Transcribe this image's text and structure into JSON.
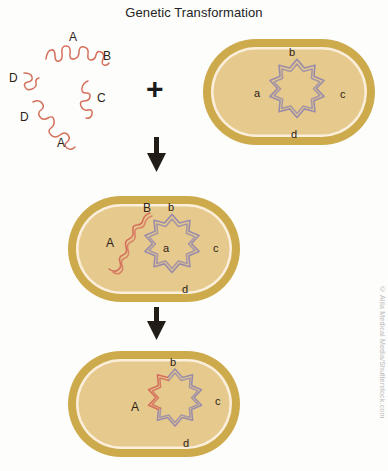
{
  "title": "Genetic Transformation",
  "credit": "© Alila Medical Media/Shutterstock.com",
  "colors": {
    "background": "#fdfdfb",
    "cell_wall": "#cdab4c",
    "cell_membrane": "#fbeedb",
    "cytoplasm": "#e6c98d",
    "donor_dna": "#d4705c",
    "chromosome": "#9b8da9",
    "arrow": "#221c16",
    "label_text": "#2c2216",
    "title_text": "#232323",
    "credit_text": "#b9b9b9"
  },
  "operators": {
    "plus": "+"
  },
  "panels": {
    "donor_dna": {
      "name": "free-donor-dna-fragments",
      "fragment_labels": [
        "A",
        "B",
        "C",
        "D",
        "D",
        "A"
      ],
      "labels": [
        {
          "text": "A",
          "x": 69,
          "y": 31
        },
        {
          "text": "B",
          "x": 103,
          "y": 50
        },
        {
          "text": "C",
          "x": 97,
          "y": 92
        },
        {
          "text": "D",
          "x": 9,
          "y": 72
        },
        {
          "text": "D",
          "x": 20,
          "y": 111
        },
        {
          "text": "A",
          "x": 57,
          "y": 137
        }
      ]
    },
    "recipient_cell": {
      "name": "recipient-bacterium",
      "chromosome_labels": [
        {
          "text": "b",
          "x": 289,
          "y": 47
        },
        {
          "text": "a",
          "x": 254,
          "y": 88
        },
        {
          "text": "c",
          "x": 340,
          "y": 89
        },
        {
          "text": "d",
          "x": 291,
          "y": 129
        }
      ]
    },
    "uptake_cell": {
      "name": "bacterium-with-internalized-dna",
      "donor_labels": [
        {
          "text": "A",
          "x": 106,
          "y": 237
        },
        {
          "text": "B",
          "x": 143,
          "y": 202
        }
      ],
      "chromosome_labels": [
        {
          "text": "b",
          "x": 168,
          "y": 202
        },
        {
          "text": "a",
          "x": 163,
          "y": 243
        },
        {
          "text": "c",
          "x": 213,
          "y": 243
        },
        {
          "text": "d",
          "x": 182,
          "y": 284
        }
      ]
    },
    "recombinant_cell": {
      "name": "transformed-bacterium",
      "donor_labels": [
        {
          "text": "A",
          "x": 131,
          "y": 401
        }
      ],
      "chromosome_labels": [
        {
          "text": "b",
          "x": 170,
          "y": 357
        },
        {
          "text": "c",
          "x": 215,
          "y": 396
        },
        {
          "text": "d",
          "x": 183,
          "y": 438
        }
      ]
    }
  }
}
